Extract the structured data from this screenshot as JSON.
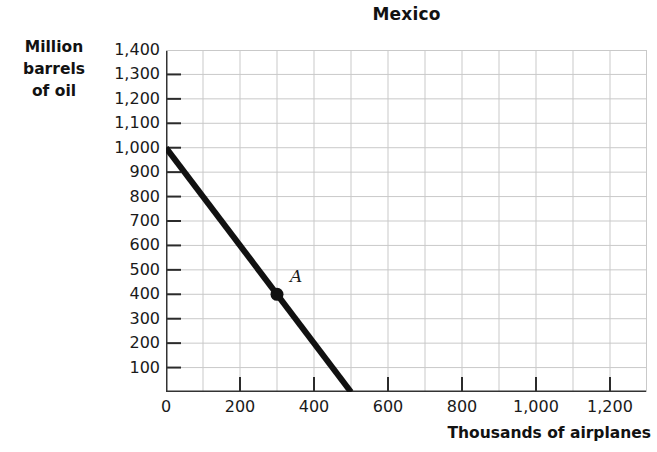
{
  "chart_data": {
    "type": "line",
    "title": "Mexico",
    "xlabel": "Thousands of airplanes",
    "ylabel": "Million barrels of oil",
    "ylabel_lines": [
      "Million",
      "barrels",
      "of oil"
    ],
    "xlim": [
      0,
      1300
    ],
    "ylim": [
      0,
      1400
    ],
    "grid": true,
    "grid_step_x": 100,
    "grid_step_y": 100,
    "legend": "none",
    "xticks": [
      0,
      200,
      400,
      600,
      800,
      1000,
      1200
    ],
    "xtick_labels": [
      "0",
      "200",
      "400",
      "600",
      "800",
      "1,000",
      "1,200"
    ],
    "yticks": [
      100,
      200,
      300,
      400,
      500,
      600,
      700,
      800,
      900,
      1000,
      1100,
      1200,
      1300,
      1400
    ],
    "ytick_labels": [
      "100",
      "200",
      "300",
      "400",
      "500",
      "600",
      "700",
      "800",
      "900",
      "1,000",
      "1,100",
      "1,200",
      "1,300",
      "1,400"
    ],
    "series": [
      {
        "name": "Production possibilities frontier",
        "color": "#111111",
        "x": [
          0,
          500
        ],
        "values": [
          1000,
          0
        ]
      }
    ],
    "annotations": [
      {
        "label": "A",
        "x": 300,
        "y": 400,
        "marker": "filled-circle",
        "color": "#111111"
      }
    ],
    "axis_color": "#333333",
    "grid_color": "#c9c9c9"
  }
}
